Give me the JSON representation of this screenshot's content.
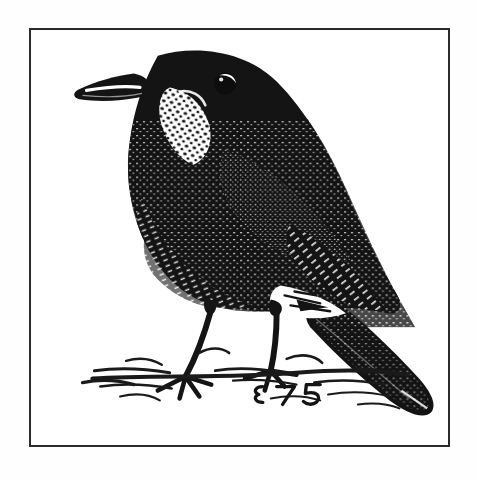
{
  "image": {
    "kind": "pen-and-ink-illustration",
    "title": "Bird illustration",
    "subject": "thrush-perched-on-ground",
    "description": "Black and white pen-and-ink drawing of a dark thrush-like bird standing in profile facing left, with a speckled throat, stippled wing and breast, long pointed tail angled down to the right, two slender legs, and sketched grass beneath its feet.",
    "style": "stippled ink hatching, high contrast black on white",
    "orientation": "facing-left",
    "background_color": "#fefefe"
  },
  "frame": {
    "present": true,
    "shape": "rectangle",
    "stroke_color": "#2b2b2b",
    "stroke_width_px": 2,
    "fill_color": "#ffffff",
    "x": 29,
    "y": 28,
    "width": 421,
    "height": 419
  },
  "palette": {
    "ink": "#161616",
    "ink_soft": "#2b2b2b",
    "paper": "#ffffff",
    "page": "#fefefe"
  },
  "signature": {
    "present": true,
    "text": "E 7 S",
    "note": "stylized artist monogram drawn in ink near the bird's feet",
    "x": 252,
    "y": 392
  },
  "parts": [
    {
      "name": "beak",
      "label": "Beak",
      "note": "pointed, angled down-left, white highlight stripe along upper mandible"
    },
    {
      "name": "eye",
      "label": "Eye",
      "note": "dark round eye with white crescent highlight"
    },
    {
      "name": "throat",
      "label": "Throat",
      "note": "white speckled / mottled patch"
    },
    {
      "name": "breast",
      "label": "Breast",
      "note": "dense stipple with pale flecks"
    },
    {
      "name": "wing",
      "label": "Wing",
      "note": "folded wing, heavy hatching with white dashes"
    },
    {
      "name": "tail",
      "label": "Tail",
      "note": "long, solid black, angled down to lower right"
    },
    {
      "name": "legs",
      "label": "Legs",
      "note": "two thin legs with splayed toes"
    },
    {
      "name": "ground",
      "label": "Ground",
      "note": "loose ink strokes indicating grass and soil"
    }
  ]
}
